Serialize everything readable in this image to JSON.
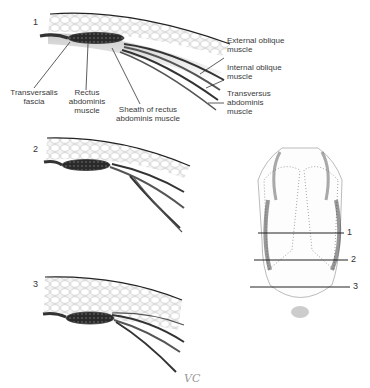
{
  "figure": {
    "panels": [
      {
        "number": "1"
      },
      {
        "number": "2"
      },
      {
        "number": "3"
      }
    ],
    "labels": {
      "transversalis": [
        "Transversalis",
        "fascia"
      ],
      "rectus": [
        "Rectus",
        "abdominis",
        "muscle"
      ],
      "sheath": [
        "Sheath of rectus",
        "abdominis muscle"
      ],
      "external": [
        "External oblique",
        "muscle"
      ],
      "internal": [
        "Internal oblique",
        "muscle"
      ],
      "transversus": [
        "Transversus",
        "abdominis",
        "muscle"
      ]
    },
    "torso_levels": [
      "1",
      "2",
      "3"
    ],
    "signature": "VC"
  }
}
